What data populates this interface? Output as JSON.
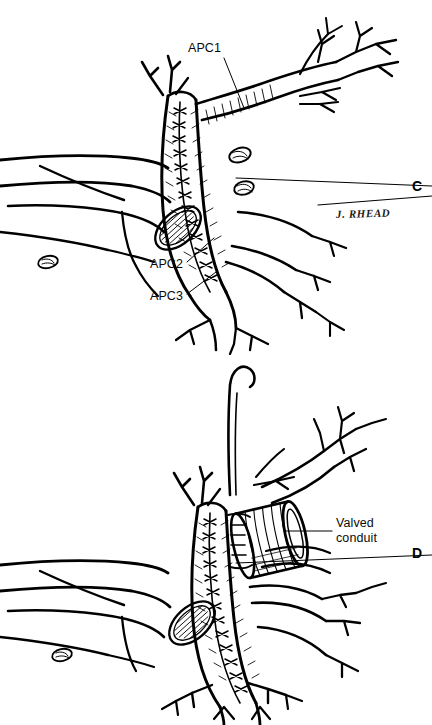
{
  "figure": {
    "type": "medical-line-illustration",
    "background_color": "#ffffff",
    "ink_color": "#000000"
  },
  "panels": [
    {
      "id": "C",
      "letter": "C",
      "labels": [
        {
          "id": "apc1",
          "text": "APC1"
        },
        {
          "id": "apc2",
          "text": "APC2"
        },
        {
          "id": "apc3",
          "text": "APC3"
        }
      ],
      "signature": "J. RHEAD"
    },
    {
      "id": "D",
      "letter": "D",
      "labels": [
        {
          "id": "valved-conduit",
          "line1": "Valved",
          "line2": "conduit"
        }
      ]
    }
  ],
  "panel_c": {
    "letter": "C",
    "apc1": "APC1",
    "apc2": "APC2",
    "apc3": "APC3",
    "signature": "J. RHEAD"
  },
  "panel_d": {
    "letter": "D",
    "valved_conduit_line1": "Valved",
    "valved_conduit_line2": "conduit"
  }
}
